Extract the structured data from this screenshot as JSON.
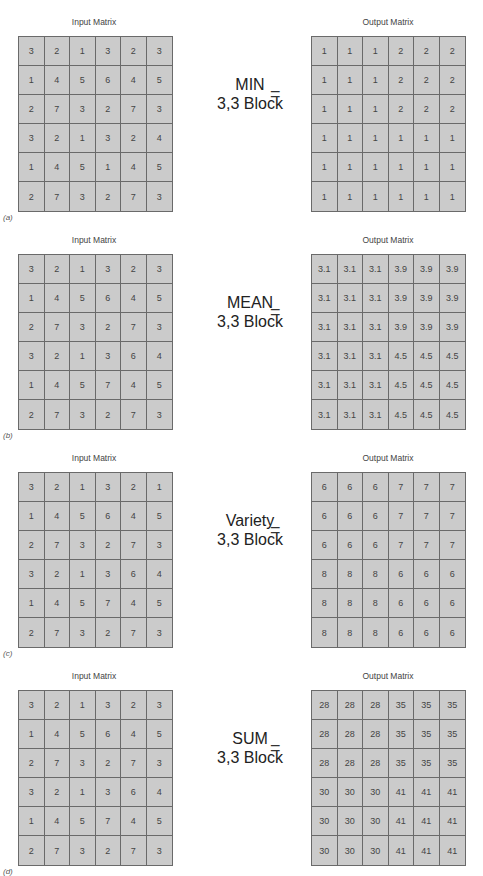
{
  "panels": [
    {
      "tag": "(a)",
      "input_title": "Input Matrix",
      "output_title": "Output Matrix",
      "operation": "MIN",
      "block": "3,3 Block",
      "equals": "=",
      "input": [
        [
          3,
          2,
          1,
          3,
          2,
          3
        ],
        [
          1,
          4,
          5,
          6,
          4,
          5
        ],
        [
          2,
          7,
          3,
          2,
          7,
          3
        ],
        [
          3,
          2,
          1,
          3,
          2,
          4
        ],
        [
          1,
          4,
          5,
          1,
          4,
          5
        ],
        [
          2,
          7,
          3,
          2,
          7,
          3
        ]
      ],
      "output": [
        [
          1,
          1,
          1,
          2,
          2,
          2
        ],
        [
          1,
          1,
          1,
          2,
          2,
          2
        ],
        [
          1,
          1,
          1,
          2,
          2,
          2
        ],
        [
          1,
          1,
          1,
          1,
          1,
          1
        ],
        [
          1,
          1,
          1,
          1,
          1,
          1
        ],
        [
          1,
          1,
          1,
          1,
          1,
          1
        ]
      ]
    },
    {
      "tag": "(b)",
      "input_title": "Input Matrix",
      "output_title": "Output Matrix",
      "operation": "MEAN",
      "block": "3,3 Block",
      "equals": "=",
      "input": [
        [
          3,
          2,
          1,
          3,
          2,
          3
        ],
        [
          1,
          4,
          5,
          6,
          4,
          5
        ],
        [
          2,
          7,
          3,
          2,
          7,
          3
        ],
        [
          3,
          2,
          1,
          3,
          6,
          4
        ],
        [
          1,
          4,
          5,
          7,
          4,
          5
        ],
        [
          2,
          7,
          3,
          2,
          7,
          3
        ]
      ],
      "output": [
        [
          "3.1",
          "3.1",
          "3.1",
          "3.9",
          "3.9",
          "3.9"
        ],
        [
          "3.1",
          "3.1",
          "3.1",
          "3.9",
          "3.9",
          "3.9"
        ],
        [
          "3.1",
          "3.1",
          "3.1",
          "3.9",
          "3.9",
          "3.9"
        ],
        [
          "3.1",
          "3.1",
          "3.1",
          "4.5",
          "4.5",
          "4.5"
        ],
        [
          "3.1",
          "3.1",
          "3.1",
          "4.5",
          "4.5",
          "4.5"
        ],
        [
          "3.1",
          "3.1",
          "3.1",
          "4.5",
          "4.5",
          "4.5"
        ]
      ]
    },
    {
      "tag": "(c)",
      "input_title": "Input Matrix",
      "output_title": "Output Matrix",
      "operation": "Variety",
      "block": "3,3 Block",
      "equals": "=",
      "input": [
        [
          3,
          2,
          1,
          3,
          2,
          1
        ],
        [
          1,
          4,
          5,
          6,
          4,
          5
        ],
        [
          2,
          7,
          3,
          2,
          7,
          3
        ],
        [
          3,
          2,
          1,
          3,
          6,
          4
        ],
        [
          1,
          4,
          5,
          7,
          4,
          5
        ],
        [
          2,
          7,
          3,
          2,
          7,
          3
        ]
      ],
      "output": [
        [
          6,
          6,
          6,
          7,
          7,
          7
        ],
        [
          6,
          6,
          6,
          7,
          7,
          7
        ],
        [
          6,
          6,
          6,
          7,
          7,
          7
        ],
        [
          8,
          8,
          8,
          6,
          6,
          6
        ],
        [
          8,
          8,
          8,
          6,
          6,
          6
        ],
        [
          8,
          8,
          8,
          6,
          6,
          6
        ]
      ]
    },
    {
      "tag": "(d)",
      "input_title": "Input Matrix",
      "output_title": "Output Matrix",
      "operation": "SUM",
      "block": "3,3 Block",
      "equals": "=",
      "input": [
        [
          3,
          2,
          1,
          3,
          2,
          3
        ],
        [
          1,
          4,
          5,
          6,
          4,
          5
        ],
        [
          2,
          7,
          3,
          2,
          7,
          3
        ],
        [
          3,
          2,
          1,
          3,
          6,
          4
        ],
        [
          1,
          4,
          5,
          7,
          4,
          5
        ],
        [
          2,
          7,
          3,
          2,
          7,
          3
        ]
      ],
      "output": [
        [
          28,
          28,
          28,
          35,
          35,
          35
        ],
        [
          28,
          28,
          28,
          35,
          35,
          35
        ],
        [
          28,
          28,
          28,
          35,
          35,
          35
        ],
        [
          30,
          30,
          30,
          41,
          41,
          41
        ],
        [
          30,
          30,
          30,
          41,
          41,
          41
        ],
        [
          30,
          30,
          30,
          41,
          41,
          41
        ]
      ]
    }
  ],
  "colors": {
    "cell_bg": "#cbcbcb",
    "grid_line": "#6a6a6a",
    "text": "#333333"
  }
}
